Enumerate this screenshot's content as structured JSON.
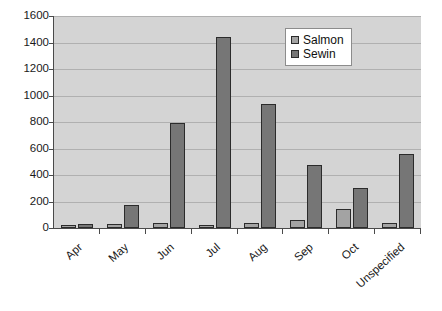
{
  "chart_data": {
    "type": "bar",
    "title": "",
    "subtitle": "",
    "xlabel": "",
    "ylabel": "",
    "categories": [
      "Apr",
      "May",
      "Jun",
      "Jul",
      "Aug",
      "Sep",
      "Oct",
      "Unspecified"
    ],
    "series": [
      {
        "name": "Salmon",
        "color": "#a3a3a3",
        "values": [
          10,
          30,
          35,
          15,
          40,
          60,
          145,
          35
        ]
      },
      {
        "name": "Sewin",
        "color": "#767676",
        "values": [
          30,
          175,
          790,
          1440,
          935,
          475,
          305,
          555
        ]
      }
    ],
    "ylim": [
      0,
      1600
    ],
    "ytick_values": [
      0,
      200,
      400,
      600,
      800,
      1000,
      1200,
      1400,
      1600
    ],
    "ytick_labels": [
      "0",
      "200",
      "400",
      "600",
      "800",
      "1000",
      "1200",
      "1400",
      "1600"
    ],
    "grid": true,
    "grid_axis": "y",
    "legend_position": "top-right",
    "xtick_rotation": -42,
    "plot_background": "#d4d4d4",
    "figure_background": "#ffffff",
    "axis_color": "#4a4a4a",
    "gridline_color": "#b0b0b0"
  }
}
